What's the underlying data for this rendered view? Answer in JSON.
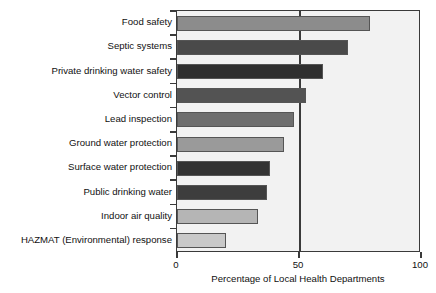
{
  "chart_data": {
    "type": "bar",
    "orientation": "horizontal",
    "title": "",
    "xlabel": "Percentage of Local Health Departments",
    "ylabel": "",
    "xlim": [
      0,
      100
    ],
    "xticks": [
      0,
      50,
      100
    ],
    "xtick_labels": [
      "0",
      "50",
      "100"
    ],
    "grid": "vertical gridline at 50",
    "legend": "none",
    "categories": [
      "Food safety",
      "Septic systems",
      "Private drinking water safety",
      "Vector control",
      "Lead inspection",
      "Ground water protection",
      "Surface water protection",
      "Public drinking water",
      "Indoor air quality",
      "HAZMAT (Environmental) response"
    ],
    "values": [
      79,
      70,
      60,
      53,
      48,
      44,
      38,
      37,
      33,
      20
    ],
    "bar_colors": [
      "#8c8c8c",
      "#4a4a4a",
      "#2f2f2f",
      "#535353",
      "#6e6e6e",
      "#9a9a9a",
      "#333333",
      "#3d3d3d",
      "#b5b5b5",
      "#c9c9c9"
    ],
    "plot_background": "#f2f2f2",
    "axis_color": "#3a3a3a"
  }
}
